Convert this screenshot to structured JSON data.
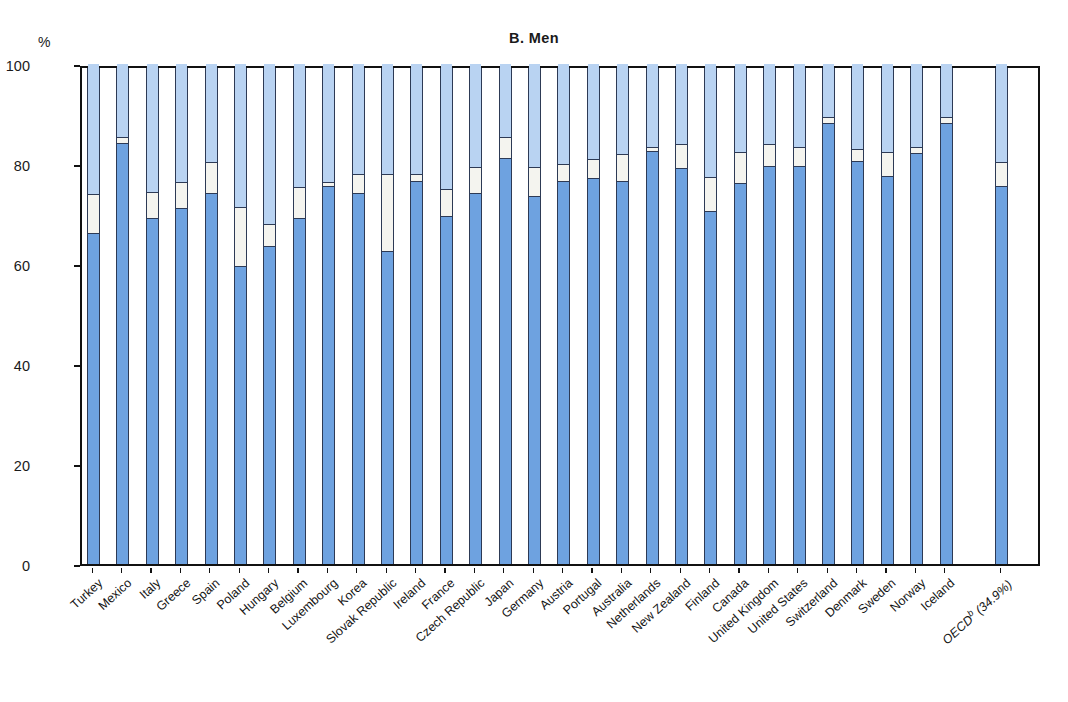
{
  "chart_data": {
    "type": "bar",
    "subtype": "stacked-bar-100",
    "title": "B.  Men",
    "xlabel": "",
    "ylabel": "%",
    "ylim": [
      0,
      100
    ],
    "yticks": [
      0,
      20,
      40,
      60,
      80,
      100
    ],
    "grid": false,
    "legend_position": "none",
    "series": [
      {
        "name": "Employed",
        "color": "#6ea2e0"
      },
      {
        "name": "Unemployed",
        "color": "#f4f4ef"
      },
      {
        "name": "Inactive",
        "color": "#b9d3f2"
      }
    ],
    "categories": [
      "Turkey",
      "Mexico",
      "Italy",
      "Greece",
      "Spain",
      "Poland",
      "Hungary",
      "Belgium",
      "Luxembourg",
      "Korea",
      "Slovak Republic",
      "Ireland",
      "France",
      "Czech Republic",
      "Japan",
      "Germany",
      "Austria",
      "Portugal",
      "Australia",
      "Netherlands",
      "New Zealand",
      "Finland",
      "Canada",
      "United Kingdom",
      "United States",
      "Switzerland",
      "Denmark",
      "Sweden",
      "Norway",
      "Iceland",
      "OECD (34.9%)"
    ],
    "employed": [
      66.0,
      84.0,
      69.0,
      71.0,
      74.0,
      59.5,
      63.5,
      69.0,
      75.5,
      74.0,
      62.5,
      76.5,
      69.5,
      74.0,
      81.0,
      73.5,
      76.5,
      77.0,
      76.5,
      82.5,
      79.0,
      70.5,
      76.0,
      79.5,
      79.5,
      88.0,
      80.5,
      77.5,
      82.0,
      88.0,
      75.5
    ],
    "unemployed": [
      8.0,
      1.5,
      5.5,
      5.5,
      6.5,
      12.0,
      4.5,
      6.5,
      1.0,
      4.0,
      15.5,
      1.5,
      5.5,
      5.5,
      4.5,
      6.0,
      3.5,
      4.0,
      5.5,
      1.0,
      5.0,
      7.0,
      6.5,
      4.5,
      4.0,
      1.5,
      2.5,
      5.0,
      1.5,
      1.5,
      5.0
    ],
    "inactive": [
      26.0,
      14.5,
      25.5,
      23.5,
      19.5,
      28.5,
      32.0,
      24.5,
      23.5,
      22.0,
      22.0,
      22.0,
      25.0,
      20.5,
      14.5,
      20.5,
      20.0,
      19.0,
      18.0,
      16.5,
      16.0,
      22.5,
      17.5,
      16.0,
      16.5,
      10.5,
      17.0,
      17.5,
      16.5,
      10.5,
      19.5
    ],
    "notes": {
      "oecd_footnote_marker": "b",
      "oecd_label_base": "OECD",
      "oecd_label_value": " (34.9%)"
    }
  },
  "axis": {
    "unit_label": "%",
    "tick_labels": [
      "0",
      "20",
      "40",
      "60",
      "80",
      "100"
    ]
  }
}
